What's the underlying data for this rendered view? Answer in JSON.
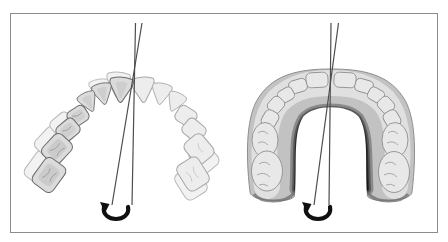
{
  "figure": {
    "type": "dental-arch-rotation-diagram",
    "background_color": "#ffffff",
    "border_color": "#8c8c8c",
    "midline_color": "#4d4d4d",
    "arrow_color": "#101010",
    "panels": {
      "left": {
        "name": "upper-dental-arch-occlusal-view"
      },
      "right": {
        "name": "lower-dental-arch-occlusal-view"
      }
    },
    "palette": {
      "tooth_fill_light": "#ededed",
      "tooth_fill_shaded": "#dbdbdb",
      "tooth_outline_dark": "#6b6b6b",
      "tooth_outline_light": "#a6a6a6",
      "arch_band_fill": "#c2c2c2",
      "arch_occlusal_fill": "#e0e0e0",
      "arch_inner_shadow": "#101010"
    }
  }
}
